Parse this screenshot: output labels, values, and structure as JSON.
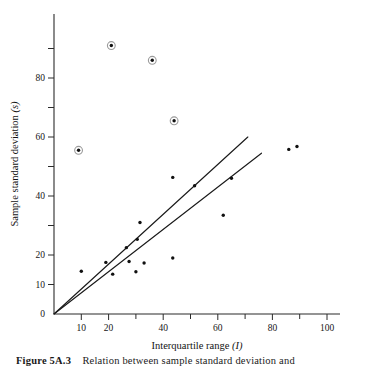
{
  "figure": {
    "caption_label": "Figure 5A.3",
    "caption_text": "Relation between sample standard deviation and",
    "xlabel_text": "Interquartile range",
    "xlabel_symbol": "(I)",
    "ylabel_text": "Sample standard deviation",
    "ylabel_symbol": "(s)"
  },
  "chart_data": {
    "type": "scatter",
    "title": "",
    "xlabel": "Interquartile range (I)",
    "ylabel": "Sample standard deviation (s)",
    "xlim": [
      0,
      100
    ],
    "ylim": [
      0,
      95
    ],
    "grid": false,
    "legend": "none",
    "x_ticks_major": [
      10,
      20,
      40,
      60,
      80,
      100
    ],
    "x_ticks_minor": [
      30,
      50,
      70,
      90
    ],
    "x_tick_labels": [
      "10",
      "20",
      "40",
      "60",
      "80",
      "100"
    ],
    "y_ticks_major": [
      0,
      10,
      20,
      40,
      60,
      80
    ],
    "y_ticks_minor": [
      30,
      50,
      70,
      90
    ],
    "y_tick_labels": [
      "0",
      "10",
      "20",
      "40",
      "60",
      "80"
    ],
    "points": [
      {
        "x": 10,
        "y": 14.5,
        "circled": false
      },
      {
        "x": 19,
        "y": 17.5,
        "circled": false
      },
      {
        "x": 21.5,
        "y": 13.5,
        "circled": false
      },
      {
        "x": 26.5,
        "y": 22.5,
        "circled": false
      },
      {
        "x": 27.5,
        "y": 17.8,
        "circled": false
      },
      {
        "x": 30,
        "y": 14.3,
        "circled": false
      },
      {
        "x": 30.5,
        "y": 25.3,
        "circled": false
      },
      {
        "x": 31.5,
        "y": 31,
        "circled": false
      },
      {
        "x": 33,
        "y": 17.3,
        "circled": false
      },
      {
        "x": 43.5,
        "y": 19,
        "circled": false
      },
      {
        "x": 43.5,
        "y": 46.3,
        "circled": false
      },
      {
        "x": 51.5,
        "y": 43.5,
        "circled": false
      },
      {
        "x": 62,
        "y": 33.5,
        "circled": false
      },
      {
        "x": 65,
        "y": 46,
        "circled": false
      },
      {
        "x": 86,
        "y": 55.8,
        "circled": false
      },
      {
        "x": 89,
        "y": 56.8,
        "circled": false
      },
      {
        "x": 9,
        "y": 55.5,
        "circled": true
      },
      {
        "x": 21,
        "y": 91,
        "circled": true
      },
      {
        "x": 36,
        "y": 86,
        "circled": true
      },
      {
        "x": 44,
        "y": 65.5,
        "circled": true
      }
    ],
    "lines": [
      {
        "name": "upper-fit-line",
        "slope": 0.845,
        "x_start": 0,
        "x_end": 71,
        "y_start": 0,
        "y_end": 60
      },
      {
        "name": "lower-fit-line",
        "slope": 0.72,
        "x_start": 0,
        "x_end": 76,
        "y_start": 0,
        "y_end": 54.5
      }
    ]
  },
  "colors": {
    "point": "#111111",
    "ring": "#9a9a9a",
    "axis": "#2b2b2b",
    "line": "#1a1a1a",
    "background": "#ffffff"
  }
}
